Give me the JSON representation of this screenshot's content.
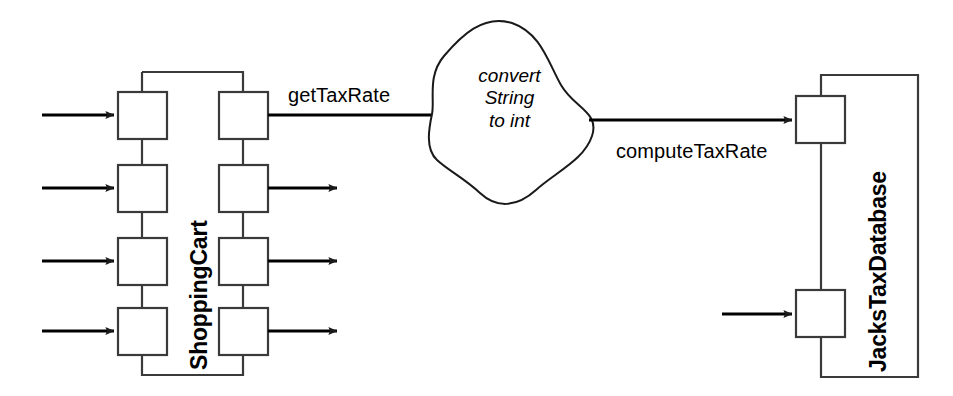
{
  "diagram": {
    "type": "software-component-port-diagram",
    "background_color": "#ffffff",
    "stroke_color": "#1a1a1a",
    "fill_color": "#ffffff",
    "components": [
      {
        "id": "shopping-cart",
        "name": "ShoppingCart",
        "label_orientation": "vertical-bottom-to-top",
        "input_ports": 4,
        "output_ports": 4
      },
      {
        "id": "jacks-tax-database",
        "name": "JacksTaxDatabase",
        "label_orientation": "vertical-bottom-to-top",
        "input_ports": 2,
        "output_ports": 0
      }
    ],
    "connector": {
      "id": "convert-blob",
      "shape": "blob",
      "lines": [
        "convert",
        "String",
        "to int"
      ],
      "text": "convert String to int"
    },
    "flows": [
      {
        "id": "flow-get-tax-rate",
        "label": "getTaxRate",
        "from": "shopping-cart",
        "to": "convert-blob"
      },
      {
        "id": "flow-compute-tax-rate",
        "label": "computeTaxRate",
        "from": "convert-blob",
        "to": "jacks-tax-database"
      }
    ],
    "unlabeled_arrows": {
      "shopping_cart_inputs": 4,
      "shopping_cart_outputs": 3,
      "jacks_tax_database_inputs": 1
    }
  }
}
